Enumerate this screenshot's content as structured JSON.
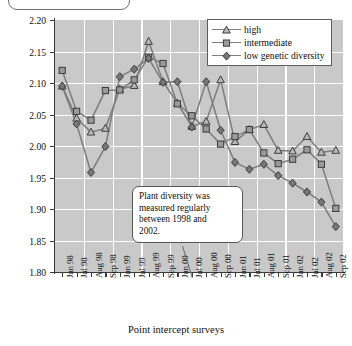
{
  "chart_data": {
    "type": "line",
    "title": "",
    "xlabel": "Point intercept surveys",
    "ylabel": "Mean Shannon-Wiener index",
    "ylim": [
      1.8,
      2.2
    ],
    "ytick_labels": [
      "2.20",
      "2.15",
      "2.10",
      "2.05",
      "2.00",
      "1.95",
      "1.90",
      "1.85",
      "1.80"
    ],
    "ytick_values": [
      2.2,
      2.15,
      2.1,
      2.05,
      2.0,
      1.95,
      1.9,
      1.85,
      1.8
    ],
    "grid": true,
    "legend_position": "top-right",
    "categories": [
      "Jun 98",
      "Jul 98",
      "Aug 98",
      "Sep 98",
      "Jun 99",
      "Jul 99",
      "Aug 99",
      "Sep 99",
      "Jun 00",
      "Jul 00",
      "Aug 00",
      "Sep 00",
      "Jun 01",
      "Jul 01",
      "Aug 01",
      "Sep 01",
      "Jun 02",
      "Jul 02",
      "Aug 02",
      "Sep 02"
    ],
    "series": [
      {
        "name": "high",
        "marker": "triangle",
        "values": [
          2.095,
          2.044,
          2.022,
          2.028,
          2.09,
          2.096,
          2.166,
          2.102,
          2.068,
          2.031,
          2.039,
          2.105,
          2.007,
          2.026,
          2.034,
          1.993,
          1.992,
          2.015,
          1.99,
          1.993
        ]
      },
      {
        "name": "intermediate",
        "marker": "square",
        "values": [
          2.12,
          2.055,
          2.041,
          2.088,
          2.089,
          2.105,
          2.141,
          2.131,
          2.067,
          2.048,
          2.027,
          2.003,
          2.015,
          2.026,
          1.989,
          1.972,
          1.979,
          1.994,
          1.971,
          1.901
        ]
      },
      {
        "name": "low genetic diversity",
        "marker": "diamond",
        "values": [
          2.095,
          2.035,
          1.958,
          1.999,
          2.11,
          2.122,
          2.139,
          2.101,
          2.102,
          2.03,
          2.102,
          2.025,
          1.974,
          1.963,
          1.971,
          1.953,
          1.941,
          1.927,
          1.911,
          1.872
        ]
      }
    ],
    "annotation": {
      "lines": [
        "Plant diversity was",
        "measured regularly",
        "between 1998 and",
        "2002."
      ]
    },
    "colors": {
      "plot_background": "#c9c9c9",
      "gridline": "#ffffff",
      "axis": "#3a3a3a",
      "series_line": "#7d7d7d",
      "marker_fill_high": "#b8b8b8",
      "marker_fill_intermediate": "#9a9a9a",
      "marker_fill_low": "#777777",
      "marker_edge": "#3c3c3c",
      "text": "#101010"
    }
  }
}
